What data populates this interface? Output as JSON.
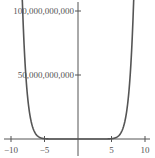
{
  "chart_data": {
    "type": "line",
    "title": "",
    "xlabel": "",
    "ylabel": "",
    "function_estimate": "y = x^12",
    "xlim": [
      -10.5,
      10.5
    ],
    "ylim": [
      -3000000000,
      110000000000
    ],
    "x_ticks": [
      -10,
      -5,
      5,
      10
    ],
    "x_tick_labels": [
      "−10",
      "−5",
      "5",
      "10"
    ],
    "y_ticks": [
      50000000000,
      100000000000
    ],
    "y_tick_labels": [
      "50,000,000,000",
      "100,000,000,000"
    ],
    "grid": false,
    "series": [
      {
        "name": "f(x)",
        "color": "#555555",
        "x": [
          -8.4,
          -8,
          -7.5,
          -7,
          -6.5,
          -6,
          -5.5,
          -5,
          -4,
          -2,
          0,
          2,
          4,
          5,
          5.5,
          6,
          6.5,
          7,
          7.5,
          8,
          8.4
        ],
        "y": [
          123000000000,
          68700000000,
          31700000000,
          13800000000,
          5660000000,
          2180000000,
          766000000,
          244000000,
          16800000,
          4096,
          0,
          4096,
          16800000,
          244000000,
          766000000,
          2180000000,
          5660000000,
          13800000000,
          31700000000,
          68700000000,
          123000000000
        ]
      }
    ]
  }
}
